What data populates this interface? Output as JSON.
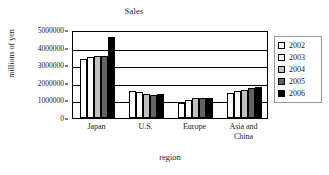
{
  "chart_data": {
    "type": "bar",
    "title": "Sales",
    "xlabel": "region",
    "ylabel": "millions of yen",
    "categories": [
      "Japan",
      "U.S.",
      "Europe",
      "Asia and\nChina"
    ],
    "series": [
      {
        "name": "2002",
        "color": "#ffffff",
        "values": [
          3350000,
          1520000,
          860000,
          1420000
        ]
      },
      {
        "name": "2003",
        "color": "#fbfbfb",
        "values": [
          3480000,
          1450000,
          1030000,
          1550000
        ]
      },
      {
        "name": "2004",
        "color": "#c0c0c0",
        "values": [
          3530000,
          1350000,
          1110000,
          1600000
        ]
      },
      {
        "name": "2005",
        "color": "#636363",
        "values": [
          3550000,
          1330000,
          1140000,
          1720000
        ]
      },
      {
        "name": "2006",
        "color": "#000000",
        "values": [
          4620000,
          1390000,
          1110000,
          1790000
        ]
      }
    ],
    "ylim": [
      0,
      5000000
    ],
    "yticks": [
      0,
      1000000,
      2000000,
      3000000,
      4000000,
      5000000
    ],
    "ytick_labels": [
      "0",
      "1000000",
      "2000000",
      "3000000",
      "4000000",
      "5000000"
    ],
    "grid": true,
    "legend_position": "right",
    "legend_entries": [
      "2002",
      "2003",
      "2004",
      "2005",
      "2006"
    ]
  }
}
